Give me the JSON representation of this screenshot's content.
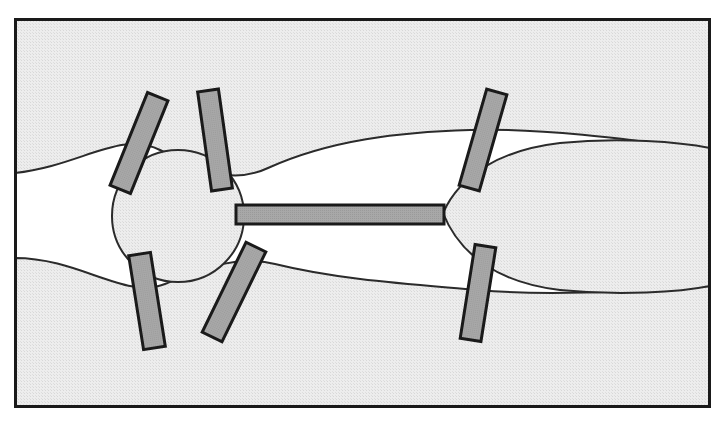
{
  "figure": {
    "canvas": {
      "width": 727,
      "height": 423
    },
    "background_color": "#ffffff",
    "frame": {
      "name": "figure-border",
      "x": 14,
      "y": 18,
      "width": 697,
      "height": 390,
      "stroke_color": "#1a1a1a",
      "stroke_width": 3,
      "fill_color": "#ffffff"
    },
    "palette": {
      "hatch_fill": "#e9e9e9",
      "hatch_dot": "#d2d2d2",
      "bar_fill": "#a6a6a6",
      "bar_stroke": "#1a1a1a",
      "outline": "#2b2b2b",
      "void_fill": "#ffffff"
    },
    "tissue_bands": [
      {
        "name": "upper-tissue-band",
        "description": "Upper shaded region filling the top of the frame, its lower edge sweeping down toward the central node and rising again toward the right.",
        "fill": "#e9e9e9",
        "stroke": "#2b2b2b",
        "stroke_width": 2,
        "path": "M 15 19 L 710 19 L 710 150 C 620 138 540 128 470 130 C 400 132 330 140 268 168 C 230 186 195 168 160 150 C 120 130 80 166 15 173 Z"
      },
      {
        "name": "lower-tissue-band",
        "description": "Lower shaded region filling the bottom of the frame, its upper edge rising toward the central node and falling toward the right.",
        "fill": "#e9e9e9",
        "stroke": "#2b2b2b",
        "stroke_width": 2,
        "path": "M 15 407 L 710 407 L 710 286 C 620 292 545 296 478 290 C 410 284 340 280 275 264 C 235 254 200 270 165 284 C 125 300 80 258 15 258 Z"
      },
      {
        "name": "right-lens-body",
        "description": "Elongated lens / ellipse shaped body at the right, joined to the central node by the straight horizontal bar and extending to the right frame edge.",
        "fill": "#e9e9e9",
        "stroke": "#2b2b2b",
        "stroke_width": 2,
        "path": "M 443 213 C 460 175 500 150 560 143 C 620 137 680 142 710 148 L 710 286 C 680 292 620 296 560 290 C 500 283 460 256 443 213 Z"
      },
      {
        "name": "central-node",
        "description": "Circular node at the left-centre of the figure where the horizontal bar terminates.",
        "fill": "#e9e9e9",
        "stroke": "#2b2b2b",
        "stroke_width": 2,
        "shape": "circle",
        "cx": 178,
        "cy": 216,
        "r": 66
      }
    ],
    "bars": [
      {
        "name": "bar-upper-left-outer",
        "label": "1",
        "cx": 139,
        "cy": 143,
        "width": 22,
        "height": 100,
        "rotation_deg": 22,
        "fill": "#a6a6a6",
        "stroke": "#1a1a1a",
        "stroke_width": 3
      },
      {
        "name": "bar-upper-left-inner",
        "label": "2",
        "cx": 215,
        "cy": 140,
        "width": 21,
        "height": 100,
        "rotation_deg": -8,
        "fill": "#a6a6a6",
        "stroke": "#1a1a1a",
        "stroke_width": 3
      },
      {
        "name": "bar-lower-left-outer",
        "label": "3",
        "cx": 147,
        "cy": 301,
        "width": 22,
        "height": 95,
        "rotation_deg": -9,
        "fill": "#a6a6a6",
        "stroke": "#1a1a1a",
        "stroke_width": 3
      },
      {
        "name": "bar-lower-left-inner",
        "label": "4",
        "cx": 234,
        "cy": 292,
        "width": 22,
        "height": 100,
        "rotation_deg": 26,
        "fill": "#a6a6a6",
        "stroke": "#1a1a1a",
        "stroke_width": 3
      },
      {
        "name": "bar-upper-right",
        "label": "5",
        "cx": 483,
        "cy": 140,
        "width": 21,
        "height": 100,
        "rotation_deg": 16,
        "fill": "#a6a6a6",
        "stroke": "#1a1a1a",
        "stroke_width": 3
      },
      {
        "name": "bar-lower-right",
        "label": "6",
        "cx": 478,
        "cy": 293,
        "width": 21,
        "height": 95,
        "rotation_deg": 9,
        "fill": "#a6a6a6",
        "stroke": "#1a1a1a",
        "stroke_width": 3
      },
      {
        "name": "bar-horizontal-connector",
        "label": "7",
        "x": 236,
        "y": 205,
        "width": 208,
        "height": 19,
        "rotation_deg": 0,
        "fill": "#a6a6a6",
        "stroke": "#1a1a1a",
        "stroke_width": 3
      }
    ]
  }
}
